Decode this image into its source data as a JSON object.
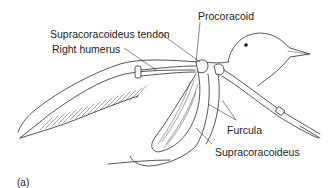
{
  "figure": {
    "panel_label": "(a)",
    "labels": [
      {
        "id": "supracoracoideus-tendon",
        "text": "Supracoracoideus tendon"
      },
      {
        "id": "right-humerus",
        "text": "Right humerus"
      },
      {
        "id": "procoracoid",
        "text": "Procoracoid"
      },
      {
        "id": "furcula",
        "text": "Furcula"
      },
      {
        "id": "supracoracoideus",
        "text": "Supracoracoideus"
      }
    ]
  }
}
